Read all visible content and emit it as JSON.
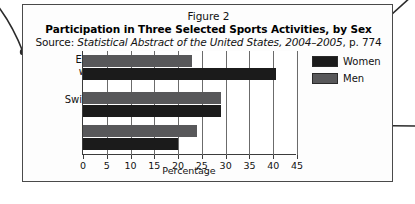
{
  "figure": {
    "number_label": "Figure 2",
    "title": "Participation in Three Selected Sports Activities, by Sex",
    "source_prefix": "Source: ",
    "source_italic": "Statistical Abstract of the United States, 2004–2005",
    "source_suffix": ", p. 774"
  },
  "legend": {
    "items": [
      {
        "label": "Women",
        "color": "#1b1b1b"
      },
      {
        "label": "Men",
        "color": "#58585a"
      }
    ]
  },
  "axis": {
    "x_title": "Percentage",
    "tick_labels": [
      "0",
      "5",
      "10",
      "15",
      "20",
      "25",
      "30",
      "35",
      "40",
      "45"
    ]
  },
  "categories": [
    {
      "line1": "Exercise",
      "line2": "walking"
    },
    {
      "line1": "Swimming",
      "line2": ""
    },
    {
      "line1": "Bicycle",
      "line2": "riding"
    }
  ],
  "annotations": {
    "callout_left": {
      "target_x": 23,
      "target_y": 52
    },
    "callout_right_top": {
      "target_x": 350,
      "target_y": 52
    },
    "callout_right_middle": {
      "target_x": 321,
      "target_y": 125
    }
  },
  "chart_data": {
    "type": "bar",
    "orientation": "horizontal",
    "title": "Participation in Three Selected Sports Activities, by Sex",
    "subtitle": "Source: Statistical Abstract of the United States, 2004–2005, p. 774",
    "figure_label": "Figure 2",
    "xlabel": "Percentage",
    "ylabel": "",
    "xlim": [
      0,
      45
    ],
    "xticks": [
      0,
      5,
      10,
      15,
      20,
      25,
      30,
      35,
      40,
      45
    ],
    "grid": true,
    "legend_position": "right",
    "categories": [
      "Exercise walking",
      "Swimming",
      "Bicycle riding"
    ],
    "series": [
      {
        "name": "Men",
        "color": "#58585a",
        "values": [
          23.0,
          29.0,
          24.0
        ]
      },
      {
        "name": "Women",
        "color": "#1b1b1b",
        "values": [
          40.5,
          29.0,
          20.0
        ]
      }
    ]
  }
}
